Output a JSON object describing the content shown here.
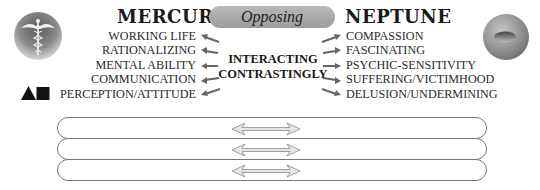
{
  "left_planet": {
    "name": "MERCURY",
    "icon": "caduceus-icon",
    "symbols": "triangle-square-icon",
    "traits": [
      "WORKING LIFE",
      "RATIONALIZING",
      "MENTAL ABILITY",
      "COMMUNICATION",
      "PERCEPTION/ATTITUDE"
    ]
  },
  "right_planet": {
    "name": "NEPTUNE",
    "icon": "neptune-sphere-icon",
    "traits": [
      "COMPASSION",
      "FASCINATING",
      "PSYCHIC-SENSITIVITY",
      "SUFFERING/VICTIMHOOD",
      "DELUSION/UNDERMINING"
    ]
  },
  "aspect": {
    "label": "Opposing",
    "center_line1": "INTERACTING",
    "center_line2": "CONTRASTINGLY"
  },
  "rows": [
    {
      "left": "",
      "right": "",
      "icon": "double-arrow-icon"
    },
    {
      "left": "",
      "right": "",
      "icon": "double-arrow-icon"
    },
    {
      "left": "",
      "right": "",
      "icon": "double-arrow-icon"
    }
  ],
  "colors": {
    "pill_fill": "#a8a8a8",
    "arrow": "#666666",
    "row_border": "#777777"
  }
}
